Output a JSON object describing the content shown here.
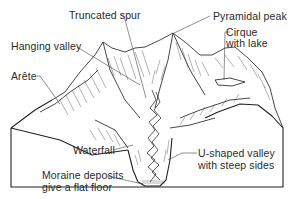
{
  "diagram": {
    "type": "annotated illustration",
    "labels": [
      {
        "id": "truncated-spur",
        "text": "Truncated spur"
      },
      {
        "id": "pyramidal-peak",
        "text": "Pyramidal peak"
      },
      {
        "id": "hanging-valley",
        "text": "Hanging valley"
      },
      {
        "id": "cirque-line1",
        "text": "Cirque"
      },
      {
        "id": "cirque-line2",
        "text": "with lake"
      },
      {
        "id": "arete",
        "text": "Arête"
      },
      {
        "id": "waterfall",
        "text": "Waterfall"
      },
      {
        "id": "u-valley-line1",
        "text": "U-shaped valley"
      },
      {
        "id": "u-valley-line2",
        "text": "with steep sides"
      },
      {
        "id": "moraine-line1",
        "text": "Moraine deposits"
      },
      {
        "id": "moraine-line2",
        "text": "give a flat floor"
      }
    ],
    "colors": {
      "ink": "#222222",
      "background": "#ffffff"
    }
  }
}
